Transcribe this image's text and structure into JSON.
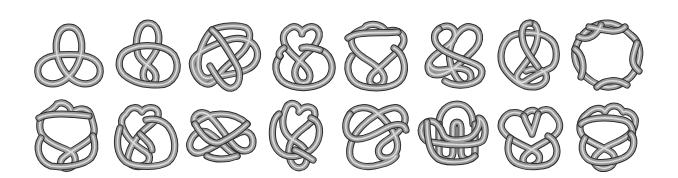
{
  "figure": {
    "rows": 2,
    "columns": 8,
    "tube_colors": {
      "outline": "#2e2e2e",
      "fill": "#9a9a9a",
      "highlight": "#dcdcdc",
      "background": "#ffffff"
    }
  },
  "knots": [
    {
      "name": "3_1",
      "description": "trefoil",
      "cx": 69,
      "cy": 57
    },
    {
      "name": "4_1",
      "description": "figure-eight",
      "cx": 148,
      "cy": 55
    },
    {
      "name": "5_1",
      "description": "cinquefoil",
      "cx": 224,
      "cy": 56
    },
    {
      "name": "5_2",
      "description": "three-twist",
      "cx": 302,
      "cy": 56
    },
    {
      "name": "6_1",
      "description": "stevedore",
      "cx": 376,
      "cy": 56
    },
    {
      "name": "6_2",
      "description": "6_2 knot",
      "cx": 455,
      "cy": 55
    },
    {
      "name": "6_3",
      "description": "6_3 knot",
      "cx": 530,
      "cy": 55
    },
    {
      "name": "7_1",
      "description": "septafoil",
      "cx": 607,
      "cy": 55
    },
    {
      "name": "7_2",
      "description": "7_2 knot",
      "cx": 67,
      "cy": 134
    },
    {
      "name": "7_3",
      "description": "7_3 knot",
      "cx": 146,
      "cy": 134
    },
    {
      "name": "7_4",
      "description": "7_4 knot",
      "cx": 221,
      "cy": 134
    },
    {
      "name": "7_5",
      "description": "7_5 knot",
      "cx": 297,
      "cy": 134
    },
    {
      "name": "7_6",
      "description": "7_6 knot",
      "cx": 374,
      "cy": 134
    },
    {
      "name": "7_7",
      "description": "7_7 knot",
      "cx": 451,
      "cy": 134
    },
    {
      "name": "8_1",
      "description": "8_1 knot",
      "cx": 530,
      "cy": 134
    },
    {
      "name": "8_2",
      "description": "8_2 knot",
      "cx": 605,
      "cy": 134
    }
  ]
}
